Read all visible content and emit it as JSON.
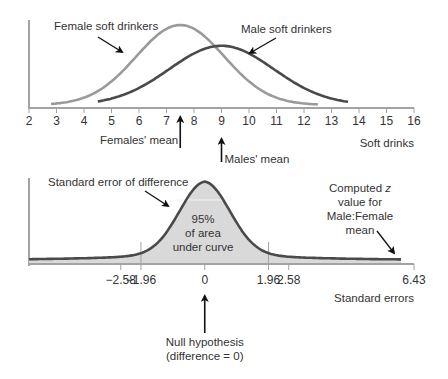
{
  "colors": {
    "axis": "#a3a3a3",
    "female_curve": "#9a9a9a",
    "male_curve": "#4a4a4a",
    "difference_curve": "#4a4a4a",
    "shaded_area": "#d9d9d9",
    "text": "#333333"
  },
  "chart_data": [
    {
      "type": "line",
      "title": "",
      "xlabel": "Soft drinks",
      "ylabel": "",
      "xlim": [
        2,
        16
      ],
      "x_ticks": [
        2,
        3,
        4,
        5,
        6,
        7,
        8,
        9,
        10,
        11,
        12,
        13,
        14,
        15,
        16
      ],
      "x_tick_labels": [
        "2",
        "3",
        "4",
        "5",
        "6",
        "7",
        "8",
        "9",
        "10",
        "11",
        "12",
        "13",
        "14",
        "15",
        "16"
      ],
      "grid": false,
      "series": [
        {
          "name": "Female soft drinkers",
          "mean": 7.5,
          "sd": 1.6,
          "x_range": [
            2.8,
            12.5
          ],
          "relative_peak": 1.0
        },
        {
          "name": "Male soft drinkers",
          "mean": 9.0,
          "sd": 1.9,
          "x_range": [
            4.5,
            13.6
          ],
          "relative_peak": 0.74
        }
      ],
      "annotations": [
        {
          "text": "Female soft drinkers",
          "points_to": "female curve"
        },
        {
          "text": "Male soft drinkers",
          "points_to": "male curve"
        },
        {
          "text": "Females' mean",
          "x": 7.5
        },
        {
          "text": "Males' mean",
          "x": 9.0
        }
      ]
    },
    {
      "type": "area",
      "title": "",
      "xlabel": "Standard errors",
      "ylabel": "",
      "xlim": [
        -5.4,
        6.43
      ],
      "x_ticks": [
        -2.58,
        -1.96,
        0,
        1.96,
        2.58,
        6.43
      ],
      "x_tick_labels": [
        "−2.58",
        "−1.96",
        "0",
        "1.96",
        "2.58",
        "6.43"
      ],
      "reference_lines": [
        -1.96,
        1.96
      ],
      "grid": false,
      "series": [
        {
          "name": "Standard error of difference",
          "distribution": "normal",
          "mean": 0,
          "sd": 1,
          "shaded_area_pct": 95
        }
      ],
      "annotations": [
        {
          "text": "Standard error of difference",
          "points_to": "curve"
        },
        {
          "text": "95% of area under curve",
          "lines": [
            "95%",
            "of area",
            "under curve"
          ]
        },
        {
          "text": "Computed z value for Male:Female mean",
          "x": 6.43,
          "lines": [
            "Computed z",
            "value for",
            "Male:Female",
            "mean"
          ]
        },
        {
          "text": "Null hypothesis (difference = 0)",
          "x": 0,
          "lines": [
            "Null hypothesis",
            "(difference = 0)"
          ]
        }
      ]
    }
  ],
  "labels": {
    "female_curve": "Female soft drinkers",
    "male_curve": "Male soft drinkers",
    "females_mean": "Females' mean",
    "males_mean": "Males' mean",
    "top_xlabel": "Soft drinks",
    "se_difference": "Standard error of difference",
    "area_pct": "95%",
    "area_line2": "of area",
    "area_line3": "under curve",
    "computed_line1": "Computed ",
    "computed_z": "z",
    "computed_line2": "value for",
    "computed_line3": "Male:Female",
    "computed_line4": "mean",
    "bottom_xlabel": "Standard errors",
    "null_line1": "Null hypothesis",
    "null_line2": "(difference = 0)"
  }
}
